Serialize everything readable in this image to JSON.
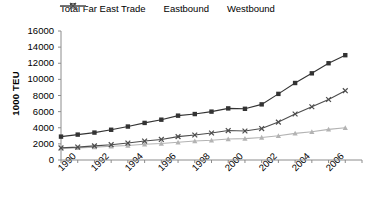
{
  "chart_data": {
    "type": "line",
    "title": "",
    "xlabel": "",
    "ylabel": "1000 TEU",
    "x": [
      1990,
      1991,
      1992,
      1993,
      1994,
      1995,
      1996,
      1997,
      1998,
      1999,
      2000,
      2001,
      2002,
      2003,
      2004,
      2005,
      2006,
      2007
    ],
    "xlim": [
      1990,
      2008
    ],
    "ylim": [
      0,
      16000
    ],
    "ytick_step": 2000,
    "grid": false,
    "legend_position": "top",
    "series": [
      {
        "name": "Total Far East Trade",
        "marker": "square",
        "color": "#333333",
        "values": [
          2900,
          3150,
          3400,
          3750,
          4150,
          4600,
          5000,
          5500,
          5700,
          6000,
          6400,
          6350,
          6900,
          8200,
          9550,
          10750,
          12000,
          13000
        ]
      },
      {
        "name": "Eastbound",
        "marker": "triangle",
        "color": "#b3b3b3",
        "values": [
          1450,
          1500,
          1600,
          1700,
          1800,
          1950,
          2050,
          2200,
          2350,
          2450,
          2600,
          2650,
          2800,
          3000,
          3300,
          3500,
          3800,
          4000
        ]
      },
      {
        "name": "Westbound",
        "marker": "x",
        "color": "#4d4d4d",
        "values": [
          1500,
          1600,
          1750,
          1900,
          2100,
          2350,
          2550,
          2900,
          3100,
          3350,
          3650,
          3600,
          3900,
          4700,
          5700,
          6600,
          7500,
          8600
        ]
      }
    ]
  },
  "axes": {
    "y_ticks": [
      "0",
      "2000",
      "4000",
      "6000",
      "8000",
      "10000",
      "12000",
      "14000",
      "16000"
    ],
    "x_ticks": [
      "1990",
      "1992",
      "1994",
      "1996",
      "1998",
      "2000",
      "2002",
      "2004",
      "2006"
    ]
  },
  "legend": {
    "items": [
      {
        "label": "Total Far East Trade",
        "icon": "square-marker-icon"
      },
      {
        "label": "Eastbound",
        "icon": "triangle-marker-icon"
      },
      {
        "label": "Westbound",
        "icon": "x-marker-icon"
      }
    ]
  }
}
